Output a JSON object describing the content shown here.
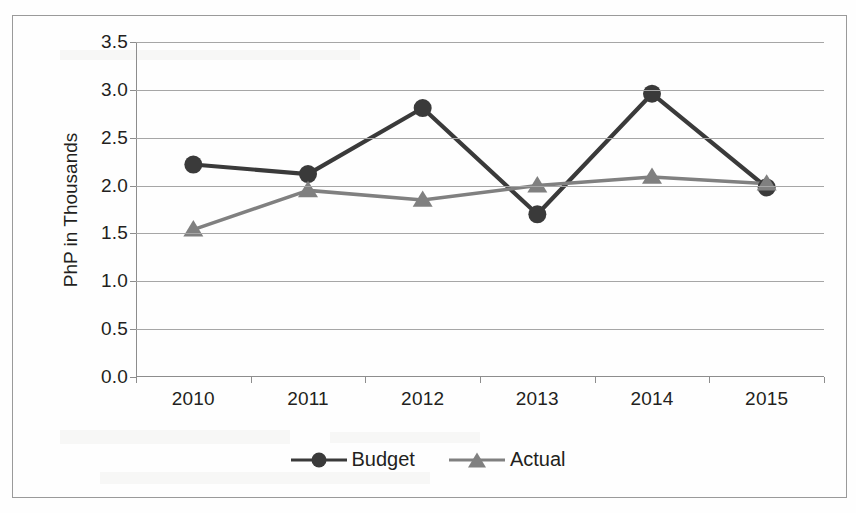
{
  "chart_data": {
    "type": "line",
    "title": "",
    "xlabel": "",
    "ylabel": "PhP in Thousands",
    "categories": [
      "2010",
      "2011",
      "2012",
      "2013",
      "2014",
      "2015"
    ],
    "series": [
      {
        "name": "Budget",
        "color": "#3a3a3a",
        "marker": "circle",
        "values": [
          2.22,
          2.12,
          2.81,
          1.7,
          2.96,
          1.98
        ]
      },
      {
        "name": "Actual",
        "color": "#808080",
        "marker": "triangle",
        "values": [
          1.54,
          1.95,
          1.85,
          2.0,
          2.09,
          2.02
        ]
      }
    ],
    "ylim": [
      0.0,
      3.5
    ],
    "y_ticks": [
      "0.0",
      "0.5",
      "1.0",
      "1.5",
      "2.0",
      "2.5",
      "3.0",
      "3.5"
    ],
    "y_tick_values": [
      0.0,
      0.5,
      1.0,
      1.5,
      2.0,
      2.5,
      3.0,
      3.5
    ],
    "grid": true,
    "legend_position": "bottom"
  },
  "legend": {
    "entries": [
      {
        "label": "Budget"
      },
      {
        "label": "Actual"
      }
    ]
  },
  "colors": {
    "budget": "#3a3a3a",
    "actual": "#808080",
    "gridline": "#a6a6a6",
    "axis": "#8d8d8d",
    "border": "#9a9a9a",
    "text": "#231f20",
    "background": "#fefefe"
  }
}
